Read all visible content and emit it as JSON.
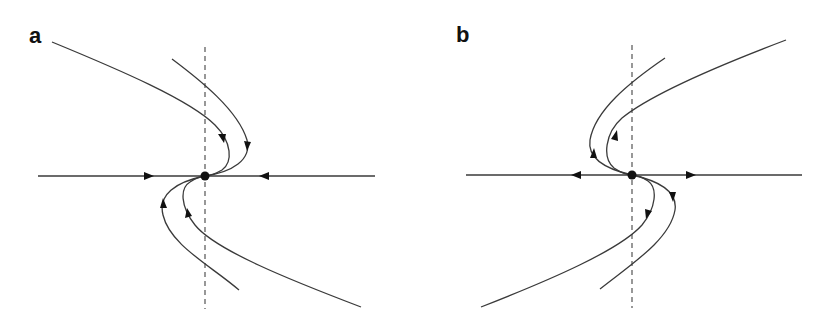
{
  "figure": {
    "panels": [
      {
        "label": "a",
        "fixed_point_type": "stable (attracting)",
        "axis_flow": "inward",
        "curve_flow": "toward fixed point"
      },
      {
        "label": "b",
        "fixed_point_type": "unstable (repelling)",
        "axis_flow": "outward",
        "curve_flow": "away from fixed point"
      }
    ],
    "colors": {
      "line": "#3a3a3a",
      "marker": "#111111",
      "background": "#ffffff"
    }
  }
}
